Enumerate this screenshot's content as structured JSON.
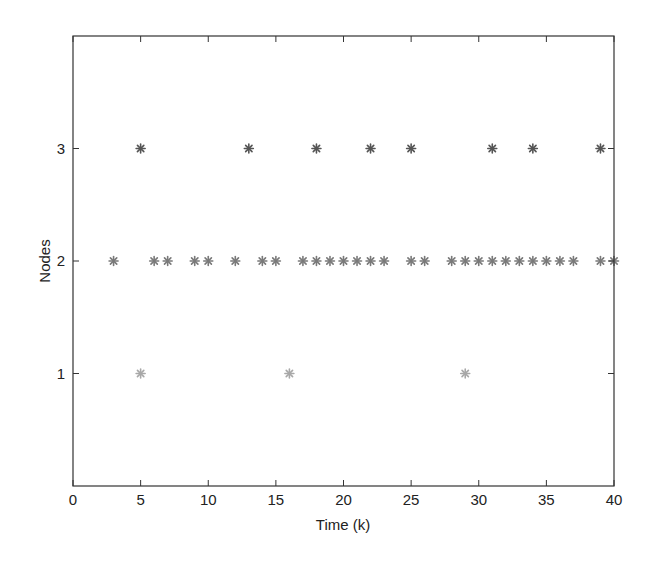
{
  "chart_data": {
    "type": "scatter",
    "title": "",
    "xlabel": "Time (k)",
    "ylabel": "Nodes",
    "xlim": [
      0,
      40
    ],
    "ylim": [
      0,
      4
    ],
    "xticks": [
      0,
      5,
      10,
      15,
      20,
      25,
      30,
      35,
      40
    ],
    "yticks": [
      1,
      2,
      3
    ],
    "grid": false,
    "legend": null,
    "marker": "asterisk",
    "series": [
      {
        "name": "Node 1",
        "y": 1,
        "color": "#a8a8a8",
        "x": [
          5,
          16,
          29
        ]
      },
      {
        "name": "Node 2",
        "y": 2,
        "color": "#7a7a7a",
        "x": [
          3,
          6,
          7,
          9,
          10,
          12,
          14,
          15,
          17,
          18,
          19,
          20,
          21,
          22,
          23,
          25,
          26,
          28,
          29,
          30,
          31,
          32,
          33,
          34,
          35,
          36,
          37,
          39,
          40
        ]
      },
      {
        "name": "Node 3",
        "y": 3,
        "color": "#555555",
        "x": [
          5,
          13,
          18,
          22,
          25,
          31,
          34,
          39
        ]
      }
    ]
  }
}
